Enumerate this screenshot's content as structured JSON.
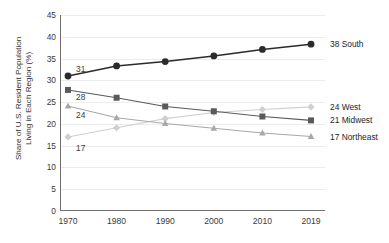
{
  "chart_data": {
    "type": "line",
    "title": "",
    "xlabel": "",
    "ylabel": "Share of U.S. Resident Population Living in Each Region (%)",
    "ylabel_line1": "Share of U.S. Resident Population",
    "ylabel_line2": "Living in Each Region (%)",
    "categories": [
      "1970",
      "1980",
      "1990",
      "2000",
      "2010",
      "2019"
    ],
    "ylim": [
      0,
      45
    ],
    "ytick_step": 5,
    "yticks": [
      "45",
      "40",
      "35",
      "30",
      "25",
      "20",
      "15",
      "10",
      "5",
      "0"
    ],
    "grid": true,
    "legend_position": "right-inline-end-labels",
    "series": [
      {
        "name": "South",
        "marker": "circle",
        "color": "#2b2b2b",
        "values": [
          31,
          33.3,
          34.3,
          35.6,
          37.1,
          38.3
        ],
        "start_label": "31",
        "end_label": "38 South"
      },
      {
        "name": "Midwest",
        "marker": "square",
        "color": "#5a5a5a",
        "values": [
          27.8,
          26,
          24,
          22.9,
          21.7,
          20.8
        ],
        "start_label": "28",
        "end_label": "21 Midwest"
      },
      {
        "name": "Northeast",
        "marker": "triangle",
        "color": "#a8a8a8",
        "values": [
          24.1,
          21.4,
          20.1,
          19,
          17.9,
          17.1
        ],
        "start_label": "24",
        "end_label": "17 Northeast"
      },
      {
        "name": "West",
        "marker": "diamond",
        "color": "#cfcfcf",
        "values": [
          17,
          19.1,
          21.2,
          22.6,
          23.3,
          23.9
        ],
        "start_label": "17",
        "end_label": "24 West"
      }
    ]
  },
  "axis_color": "#6f6f6f",
  "grid_color": "#ececec"
}
